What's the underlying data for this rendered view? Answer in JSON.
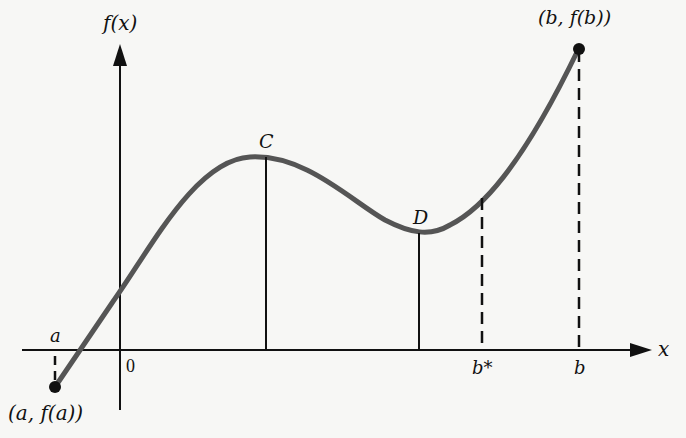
{
  "axes": {
    "y_label": "f(x)",
    "x_label": "x",
    "origin_label": "0"
  },
  "points": {
    "start": {
      "label": "(a, f(a))"
    },
    "end": {
      "label": "(b, f(b))"
    },
    "max": {
      "label": "C"
    },
    "min": {
      "label": "D"
    }
  },
  "ticks": {
    "a": "a",
    "b_star": "b*",
    "b": "b"
  },
  "colors": {
    "curve": "#555555",
    "ink": "#111111",
    "background": "#f7f7f5"
  }
}
